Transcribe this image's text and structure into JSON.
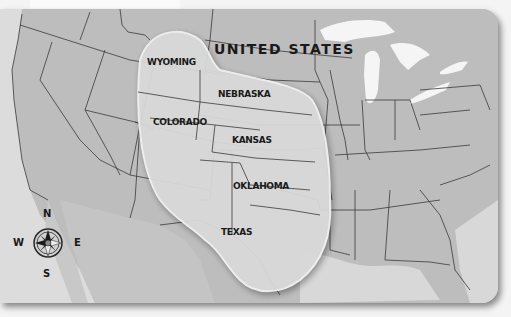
{
  "map": {
    "country_label": "UNITED STATES",
    "highlighted_region_states": [
      "WYOMING",
      "NEBRASKA",
      "COLORADO",
      "KANSAS",
      "OKLAHOMA",
      "TEXAS"
    ],
    "states": {
      "wyoming": "WYOMING",
      "nebraska": "NEBRASKA",
      "colorado": "COLORADO",
      "kansas": "KANSAS",
      "oklahoma": "OKLAHOMA",
      "texas": "TEXAS"
    },
    "compass": {
      "north": "N",
      "south": "S",
      "east": "E",
      "west": "W"
    },
    "colors": {
      "land": "#bdbdbd",
      "highlight": "#d9d9d9",
      "water": "#e4e4e4",
      "lakes": "#f5f5f5",
      "borders": "#3a3a3a",
      "text": "#1a1a1a"
    }
  }
}
